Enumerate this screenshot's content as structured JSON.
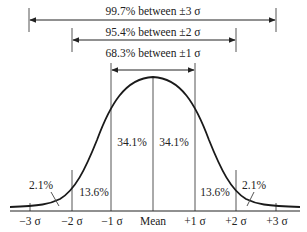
{
  "diagram": {
    "colors": {
      "curve": "#1a1a1a",
      "lines": "#555555",
      "text": "#222222",
      "background": "#ffffff"
    },
    "ranges": [
      {
        "label": "99.7% between ±3 σ",
        "from": "-3σ",
        "to": "+3σ"
      },
      {
        "label": "95.4% between ±2 σ",
        "from": "-2σ",
        "to": "+2σ"
      },
      {
        "label": "68.3% between ±1 σ",
        "from": "-1σ",
        "to": "+1σ"
      }
    ],
    "regions": {
      "left_tail": "2.1%",
      "left_mid": "13.6%",
      "left_center": "34.1%",
      "right_center": "34.1%",
      "right_mid": "13.6%",
      "right_tail": "2.1%"
    },
    "axis_labels": [
      "−3 σ",
      "−2 σ",
      "−1 σ",
      "Mean",
      "+1 σ",
      "+2 σ",
      "+3 σ"
    ]
  }
}
